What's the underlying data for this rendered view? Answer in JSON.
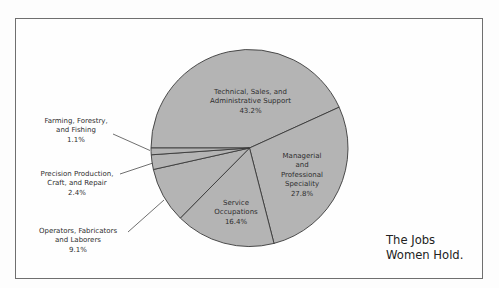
{
  "chart_data": {
    "type": "pie",
    "title": "The Jobs Women Hold.",
    "categories": [
      "Technical, Sales, and Administrative Support",
      "Managerial and Professional Speciality",
      "Service Occupations",
      "Operators, Fabricators and Laborers",
      "Precision Production, Craft, and Repair",
      "Farming, Forestry, and Fishing"
    ],
    "values": [
      43.2,
      27.8,
      16.4,
      9.1,
      2.4,
      1.1
    ],
    "unit": "%",
    "fill_color": "#b4b4b4",
    "edge_color": "#3a3a3a",
    "legend": "none (direct labels with leader lines)"
  },
  "title": {
    "line1": "The Jobs",
    "line2": "Women Hold."
  },
  "labels": {
    "technical": {
      "line1": "Technical, Sales, and",
      "line2": "Administrative Support",
      "value": "43.2%"
    },
    "managerial": {
      "line1": "Managerial",
      "line2": "and",
      "line3": "Professional",
      "line4": "Speciality",
      "value": "27.8%"
    },
    "service": {
      "line1": "Service",
      "line2": "Occupations",
      "value": "16.4%"
    },
    "farming": {
      "line1": "Farming, Forestry,",
      "line2": "and Fishing",
      "value": "1.1%"
    },
    "precision": {
      "line1": "Precision Production,",
      "line2": "Craft, and Repair",
      "value": "2.4%"
    },
    "operators": {
      "line1": "Operators, Fabricators",
      "line2": "and Laborers",
      "value": "9.1%"
    }
  }
}
